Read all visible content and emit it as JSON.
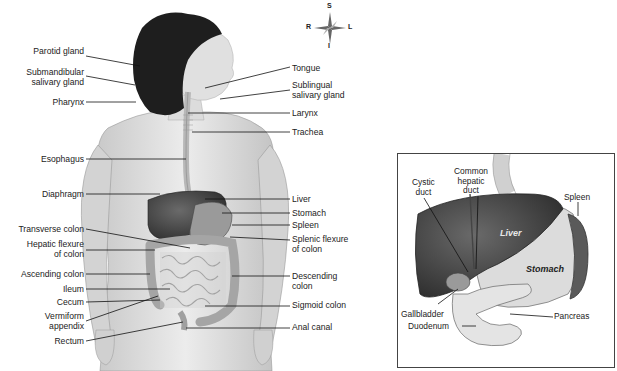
{
  "diagram": {
    "compass": {
      "superior": "S",
      "inferior": "I",
      "right": "R",
      "left": "L"
    },
    "left_labels": [
      {
        "text": [
          "Parotid gland"
        ],
        "y": 51
      },
      {
        "text": [
          "Submandibular",
          "salivary gland"
        ],
        "y": 68
      },
      {
        "text": [
          "Pharynx"
        ],
        "y": 98
      },
      {
        "text": [
          "Esophagus"
        ],
        "y": 155
      },
      {
        "text": [
          "Diaphragm"
        ],
        "y": 190
      },
      {
        "text": [
          "Transverse colon"
        ],
        "y": 225
      },
      {
        "text": [
          "Hepatic flexure",
          "of colon"
        ],
        "y": 240
      },
      {
        "text": [
          "Ascending colon"
        ],
        "y": 270
      },
      {
        "text": [
          "Ileum"
        ],
        "y": 286
      },
      {
        "text": [
          "Cecum"
        ],
        "y": 299
      },
      {
        "text": [
          "Vermiform",
          "appendix"
        ],
        "y": 313
      },
      {
        "text": [
          "Rectum"
        ],
        "y": 337
      }
    ],
    "right_labels": [
      {
        "text": [
          "Tongue"
        ],
        "y": 64
      },
      {
        "text": [
          "Sublingual",
          "salivary gland"
        ],
        "y": 81
      },
      {
        "text": [
          "Larynx"
        ],
        "y": 110
      },
      {
        "text": [
          "Trachea"
        ],
        "y": 129
      },
      {
        "text": [
          "Liver"
        ],
        "y": 195
      },
      {
        "text": [
          "Stomach"
        ],
        "y": 210
      },
      {
        "text": [
          "Spleen"
        ],
        "y": 222
      },
      {
        "text": [
          "Splenic flexure",
          "of colon"
        ],
        "y": 235
      },
      {
        "text": [
          "Descending",
          "colon"
        ],
        "y": 272
      },
      {
        "text": [
          "Sigmoid colon"
        ],
        "y": 302
      },
      {
        "text": [
          "Anal canal"
        ],
        "y": 324
      }
    ],
    "inset": {
      "labels": {
        "cystic_duct": [
          "Cystic",
          "duct"
        ],
        "common_hepatic_duct": [
          "Common",
          "hepatic",
          "duct"
        ],
        "spleen": "Spleen",
        "liver": "Liver",
        "stomach": "Stomach",
        "gallbladder": "Gallbladder",
        "pancreas": "Pancreas",
        "duodenum": "Duodenum"
      }
    }
  }
}
